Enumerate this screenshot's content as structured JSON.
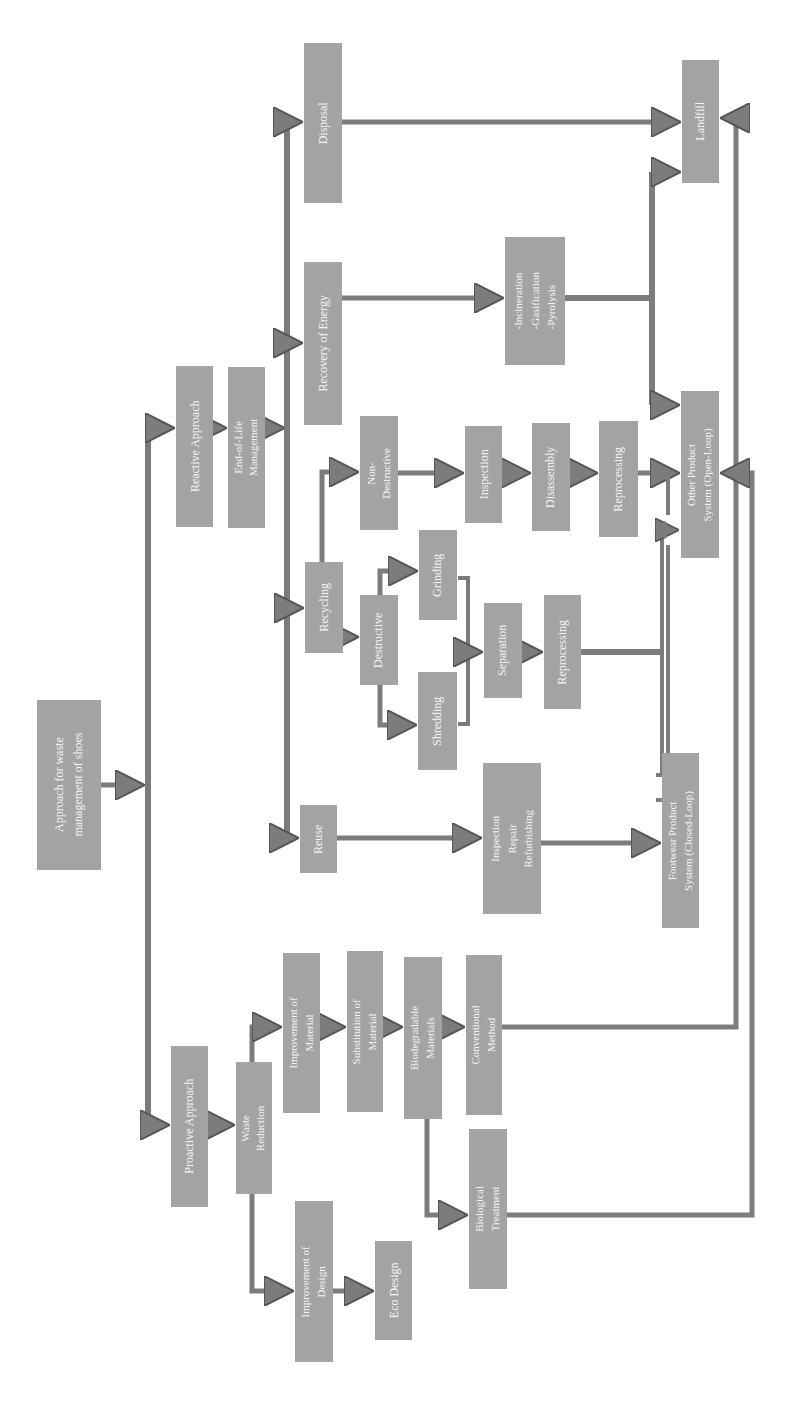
{
  "diagram": {
    "orientation": "rotated-90-ccw",
    "box_color": "#a3a3a3",
    "line_color": "#7c7c7c",
    "text_color": "#f4f4f4",
    "nodes": {
      "root": {
        "lines": [
          "Approach for waste",
          "management  of shoes"
        ]
      },
      "reactive": {
        "lines": [
          "Reactive  Approach"
        ]
      },
      "eol": {
        "lines": [
          "End-of-Life",
          "Management"
        ]
      },
      "proactive": {
        "lines": [
          "Proactive  Approach"
        ]
      },
      "waste_reduction": {
        "lines": [
          "Waste",
          "Reduction"
        ]
      },
      "disposal": {
        "lines": [
          "Disposal"
        ]
      },
      "recovery_energy": {
        "lines": [
          "Recovery of Energy"
        ]
      },
      "recycling": {
        "lines": [
          "Recycling"
        ]
      },
      "reuse": {
        "lines": [
          "Reuse"
        ]
      },
      "non_destructive": {
        "lines": [
          "Non-",
          "Destructive"
        ]
      },
      "destructive": {
        "lines": [
          "Destructive"
        ]
      },
      "grinding": {
        "lines": [
          "Grinding"
        ]
      },
      "shredding": {
        "lines": [
          "Shredding"
        ]
      },
      "separation": {
        "lines": [
          "Separation"
        ]
      },
      "reprocessing_recycle": {
        "lines": [
          "Reprocessing"
        ]
      },
      "inspection": {
        "lines": [
          "Inspection"
        ]
      },
      "disassembly": {
        "lines": [
          "Disassembly"
        ]
      },
      "reprocessing_nd": {
        "lines": [
          "Reprocessing"
        ]
      },
      "thermal": {
        "lines": [
          "-Incineration",
          "-Gasification",
          "-Pyrolysis"
        ]
      },
      "landfill": {
        "lines": [
          "Landfill"
        ]
      },
      "open_loop": {
        "lines": [
          "Other Product",
          "System  (Open-Loop)"
        ]
      },
      "irr": {
        "lines": [
          "Inspection",
          "Repair",
          "Refurbishing"
        ]
      },
      "closed_loop": {
        "lines": [
          "Footwear  Product",
          "System  (Closed-Loop)"
        ]
      },
      "improve_material": {
        "lines": [
          "Improvement  of",
          "Material"
        ]
      },
      "subst_material": {
        "lines": [
          "Substitution  of",
          "Material"
        ]
      },
      "biodegradable": {
        "lines": [
          "Biodegradable",
          "Materials"
        ]
      },
      "conventional": {
        "lines": [
          "Conventional",
          "Method"
        ]
      },
      "biological": {
        "lines": [
          "Biological",
          "Treatment"
        ]
      },
      "improve_design": {
        "lines": [
          "Improvement  of",
          "Design"
        ]
      },
      "eco_design": {
        "lines": [
          "Eco  Design"
        ]
      }
    }
  }
}
